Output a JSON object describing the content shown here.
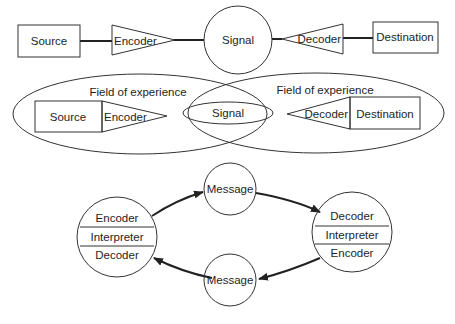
{
  "diagram": {
    "linear_model": {
      "source": "Source",
      "encoder": "Encoder",
      "signal": "Signal",
      "decoder": "Decoder",
      "destination": "Destination"
    },
    "field_of_experience_model": {
      "left_field_label": "Field of experience",
      "right_field_label": "Field of experience",
      "source": "Source",
      "encoder": "Encoder",
      "signal": "Signal",
      "decoder": "Decoder",
      "destination": "Destination"
    },
    "interactive_model": {
      "left_participant": {
        "top": "Encoder",
        "middle": "Interpreter",
        "bottom": "Decoder"
      },
      "right_participant": {
        "top": "Decoder",
        "middle": "Interpreter",
        "bottom": "Encoder"
      },
      "top_message": "Message",
      "bottom_message": "Message"
    }
  }
}
